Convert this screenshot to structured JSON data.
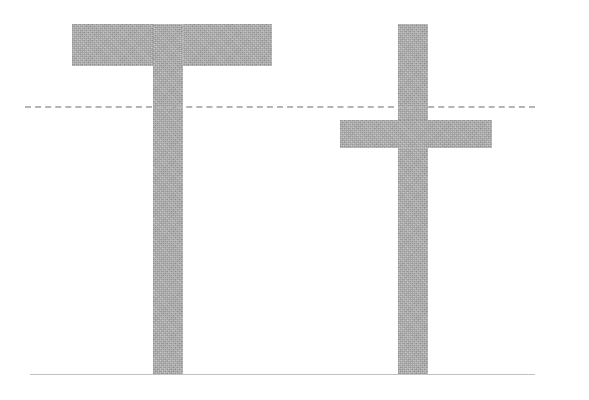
{
  "figure": {
    "type": "typography-glyph-diagram",
    "canvas": {
      "width": 589,
      "height": 400,
      "background": "#ffffff"
    },
    "glyph_color": "#a9a9a9",
    "guide_color_dashed": "#b4b4b4",
    "guide_color_solid": "#c2c2c2",
    "glyphs": [
      {
        "id": "uppercase-t",
        "character": "T",
        "case": "uppercase",
        "parts": [
          {
            "id": "t-upper-bar",
            "name": "crossbar",
            "x": 72,
            "y": 24,
            "width": 200,
            "height": 42
          },
          {
            "id": "t-upper-stem",
            "name": "stem",
            "x": 153,
            "y": 24,
            "width": 30,
            "height": 351
          }
        ]
      },
      {
        "id": "lowercase-t",
        "character": "t",
        "case": "lowercase",
        "parts": [
          {
            "id": "t-lower-stem",
            "name": "stem",
            "x": 398,
            "y": 24,
            "width": 30,
            "height": 351
          },
          {
            "id": "t-lower-bar",
            "name": "crossbar",
            "x": 340,
            "y": 120,
            "width": 152,
            "height": 28
          }
        ]
      }
    ],
    "guides": [
      {
        "id": "xheight-line",
        "name": "x-height-line",
        "style": "dashed",
        "y": 107,
        "x_start": 25,
        "x_end": 535
      },
      {
        "id": "baseline-line",
        "name": "baseline",
        "style": "solid",
        "y": 375,
        "x_start": 30,
        "x_end": 535
      }
    ]
  }
}
